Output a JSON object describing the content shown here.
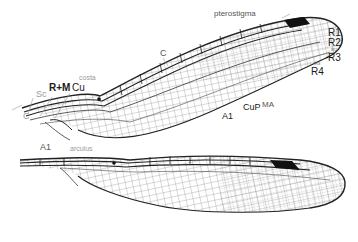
{
  "diagram": {
    "colors": {
      "vein": "#222222",
      "fine_vein": "#555555",
      "pterostigma": "#111111",
      "label_dark": "#1a1a1a",
      "label_mid": "#555555",
      "label_light": "#9a9a9a",
      "background": "#ffffff"
    },
    "labels": {
      "pterostigma": "pterostigma",
      "c_top": "C",
      "costa": "costa",
      "r_m": "R+M",
      "cu": "Cu",
      "sc": "Sc",
      "c_base": "C",
      "a1_base": "A1",
      "arculus": "arculus",
      "r1": "R1",
      "r2": "R2",
      "ir2": "IR2",
      "r3": "R3",
      "ir3": "IR3",
      "r4": "R4",
      "ma": "MA",
      "cup": "CuP",
      "a1_mid": "A1"
    },
    "wings": [
      {
        "name": "forewing",
        "has_pterostigma": true
      },
      {
        "name": "hindwing",
        "has_pterostigma": true
      }
    ]
  }
}
